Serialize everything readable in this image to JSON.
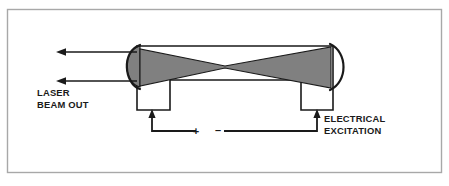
{
  "figure": {
    "type": "laser-cavity-cross-section-diagram",
    "frame": {
      "border_color": "#a8a8a8",
      "background_color": "#ffffff"
    },
    "colors": {
      "beam_fill": "#808080",
      "mirror_fill": "#808080",
      "line": "#1a1a1a",
      "frame": "#a8a8a8"
    },
    "labels": {
      "output_line1": "LASER",
      "output_line2": "BEAM OUT",
      "excitation_line1": "ELECTRICAL",
      "excitation_line2": "EXCITATION",
      "polarity_positive": "+",
      "polarity_negative": "–"
    },
    "parts": {
      "left_mirror": "left-curved-mirror",
      "right_mirror": "right-curved-mirror",
      "beam": "intracavity-beam-hourglass",
      "body": "laser-tube-body",
      "left_electrode": "left-electrode-leg",
      "right_electrode": "right-electrode-leg",
      "circuit": "excitation-circuit-wiring",
      "output_arrow_upper": "laser-output-arrow-upper",
      "output_arrow_lower": "laser-output-arrow-lower",
      "left_electrode_arrow": "left-electrode-current-arrow",
      "right_electrode_arrow": "right-electrode-current-arrow"
    }
  }
}
